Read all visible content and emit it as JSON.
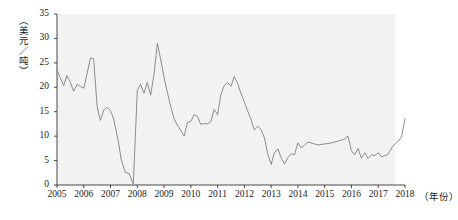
{
  "chart_data": {
    "type": "line",
    "title": "",
    "xlabel": "（年份）",
    "ylabel": "（美元／吨）",
    "ylim": [
      0,
      35
    ],
    "xlim": [
      2005,
      2018
    ],
    "grid": false,
    "legend": null,
    "y_ticks": [
      0,
      5,
      10,
      15,
      20,
      25,
      30,
      35
    ],
    "x_ticks": [
      2005,
      2006,
      2007,
      2008,
      2009,
      2010,
      2011,
      2012,
      2013,
      2014,
      2015,
      2016,
      2017,
      2018
    ],
    "line_color": "#808080",
    "panel_color": "#f2f2f2",
    "series": [
      {
        "name": "价格",
        "x": [
          2005.0,
          2005.12,
          2005.25,
          2005.37,
          2005.5,
          2005.62,
          2005.75,
          2005.87,
          2006.0,
          2006.12,
          2006.25,
          2006.37,
          2006.5,
          2006.62,
          2006.75,
          2006.87,
          2007.0,
          2007.1,
          2007.2,
          2007.3,
          2007.4,
          2007.55,
          2007.7,
          2007.85,
          2008.0,
          2008.12,
          2008.25,
          2008.37,
          2008.5,
          2008.62,
          2008.75,
          2008.87,
          2009.0,
          2009.12,
          2009.25,
          2009.37,
          2009.5,
          2009.62,
          2009.75,
          2009.87,
          2010.0,
          2010.12,
          2010.25,
          2010.37,
          2010.5,
          2010.62,
          2010.75,
          2010.87,
          2011.0,
          2011.12,
          2011.25,
          2011.37,
          2011.5,
          2011.62,
          2011.75,
          2011.87,
          2012.0,
          2012.12,
          2012.25,
          2012.37,
          2012.5,
          2012.62,
          2012.75,
          2012.87,
          2013.0,
          2013.12,
          2013.25,
          2013.37,
          2013.5,
          2013.62,
          2013.75,
          2013.87,
          2014.0,
          2014.12,
          2014.25,
          2014.37,
          2014.5,
          2014.62,
          2014.75,
          2014.87,
          2015.0,
          2015.12,
          2015.25,
          2015.37,
          2015.5,
          2015.62,
          2015.75,
          2015.87,
          2016.0,
          2016.12,
          2016.25,
          2016.37,
          2016.5,
          2016.62,
          2016.75,
          2016.87,
          2017.0,
          2017.12,
          2017.25,
          2017.37,
          2017.5,
          2017.62,
          2017.75,
          2017.87,
          2018.0
        ],
        "values": [
          23.5,
          22.0,
          20.3,
          22.4,
          21.0,
          19.2,
          20.6,
          20.2,
          19.8,
          22.7,
          26.0,
          25.8,
          16.0,
          13.2,
          15.4,
          15.9,
          15.2,
          13.8,
          11.4,
          8.6,
          5.2,
          2.6,
          2.3,
          0.2,
          19.4,
          20.6,
          18.8,
          21.0,
          18.4,
          22.5,
          29.0,
          25.8,
          22.0,
          19.0,
          16.0,
          13.6,
          12.2,
          11.2,
          10.0,
          12.8,
          13.0,
          14.4,
          14.0,
          12.4,
          12.6,
          12.5,
          13.0,
          15.5,
          14.4,
          18.5,
          20.4,
          21.0,
          20.2,
          22.2,
          20.8,
          18.8,
          17.0,
          15.2,
          13.4,
          11.3,
          12.0,
          11.4,
          9.6,
          6.4,
          4.2,
          6.6,
          7.4,
          5.6,
          4.3,
          5.6,
          6.4,
          6.2,
          8.6,
          7.6,
          8.2,
          8.8,
          8.6,
          8.4,
          8.2,
          8.3,
          8.4,
          8.5,
          8.6,
          8.8,
          9.0,
          9.2,
          9.4,
          10.0,
          7.0,
          6.2,
          7.5,
          5.5,
          6.6,
          5.4,
          6.2,
          6.0,
          6.6,
          5.8,
          6.0,
          6.3,
          7.6,
          8.4,
          9.0,
          9.8,
          13.6
        ]
      }
    ]
  },
  "axis": {
    "y_tick_labels": [
      "0",
      "5",
      "10",
      "15",
      "20",
      "25",
      "30",
      "35"
    ],
    "x_tick_labels": [
      "2005",
      "2006",
      "2007",
      "2008",
      "2009",
      "2010",
      "2011",
      "2012",
      "2013",
      "2014",
      "2015",
      "2016",
      "2017",
      "2018"
    ],
    "x_axis_title": "（年份）",
    "y_axis_title": "（美元／吨）"
  }
}
